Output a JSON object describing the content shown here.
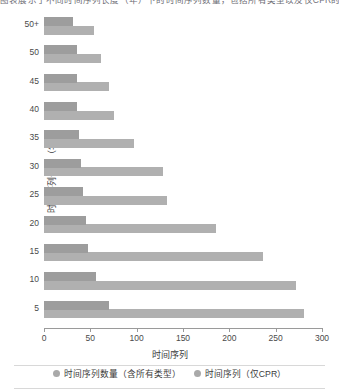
{
  "top_caption": "图表展示了不同时间序列长度（年）下的时间序列数量，包括所有类型以及仅CPR的统计。",
  "chart_data": {
    "type": "bar",
    "orientation": "horizontal",
    "title": "",
    "xlabel": "时间序列",
    "ylabel": "时间序列长度（年）",
    "categories": [
      "5",
      "10",
      "15",
      "20",
      "25",
      "30",
      "35",
      "40",
      "45",
      "50",
      "50+"
    ],
    "xlim": [
      0,
      300
    ],
    "xticks": [
      0,
      50,
      100,
      150,
      200,
      250,
      300
    ],
    "xticklabels": [
      "0",
      "50",
      "100",
      "150",
      "200",
      "250",
      "300"
    ],
    "grid": false,
    "legend_position": "bottom",
    "series": [
      {
        "name": "时间序列数量（含所有类型）",
        "color": "#b0b0b0",
        "values": [
          281,
          272,
          236,
          186,
          133,
          128,
          97,
          76,
          70,
          62,
          54
        ]
      },
      {
        "name": "时间序列（仅CPR）",
        "color": "#9d9d9d",
        "values": [
          70,
          56,
          48,
          45,
          42,
          40,
          38,
          36,
          36,
          36,
          31
        ]
      }
    ]
  },
  "axes": {
    "x_title": "时间序列",
    "y_title": "时间序列长度（年）"
  },
  "legend": {
    "items": [
      {
        "label": "时间序列数量（含所有类型）",
        "marker": "circle-marker",
        "color": "#a9a9a9"
      },
      {
        "label": "时间序列（仅CPR）",
        "marker": "circle-marker",
        "color": "#a9a9a9"
      }
    ]
  }
}
